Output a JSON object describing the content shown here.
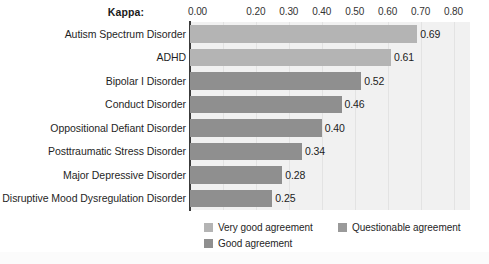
{
  "chart_data": {
    "type": "bar",
    "orientation": "horizontal",
    "title": "",
    "xlabel": "Kappa:",
    "ylabel": "",
    "xlim": [
      0.0,
      0.85
    ],
    "grid": true,
    "legend_position": "bottom",
    "categories": [
      "Autism Spectrum Disorder",
      "ADHD",
      "Bipolar I Disorder",
      "Conduct Disorder",
      "Oppositional Defiant Disorder",
      "Posttraumatic Stress Disorder",
      "Major Depressive Disorder",
      "Disruptive Mood Dysregulation Disorder"
    ],
    "values": [
      0.69,
      0.61,
      0.52,
      0.46,
      0.4,
      0.34,
      0.28,
      0.25
    ],
    "value_labels": [
      "0.69",
      "0.61",
      "0.52",
      "0.46",
      "0.40",
      "0.34",
      "0.28",
      "0.25"
    ],
    "bar_groups": [
      "Very good agreement",
      "Very good agreement",
      "Good agreement",
      "Good agreement",
      "Good agreement",
      "Good agreement",
      "Good agreement",
      "Good agreement"
    ],
    "xticks": [
      {
        "value": 0.0,
        "label": "0.00",
        "visible": true
      },
      {
        "value": 0.1,
        "label": "0.10",
        "visible": false
      },
      {
        "value": 0.2,
        "label": "0.20",
        "visible": true
      },
      {
        "value": 0.3,
        "label": "0.30",
        "visible": true
      },
      {
        "value": 0.4,
        "label": "0.40",
        "visible": true
      },
      {
        "value": 0.5,
        "label": "0.50",
        "visible": true
      },
      {
        "value": 0.6,
        "label": "0.60",
        "visible": true
      },
      {
        "value": 0.7,
        "label": "0.70",
        "visible": true
      },
      {
        "value": 0.8,
        "label": "0.80",
        "visible": true
      }
    ],
    "legend": [
      {
        "label": "Very good agreement",
        "color": "#b4b4b4"
      },
      {
        "label": "Questionable agreement",
        "color": "#9a9a9a"
      },
      {
        "label": "Good agreement",
        "color": "#8f8f8f"
      }
    ],
    "colors": {
      "very_good_agreement": "#b4b4b4",
      "good_agreement": "#8f8f8f",
      "questionable_agreement": "#9a9a9a",
      "plot_background": "#f1f1f1",
      "gridline": "#e3e3e3",
      "axis_line": "#3c3c3c"
    }
  }
}
